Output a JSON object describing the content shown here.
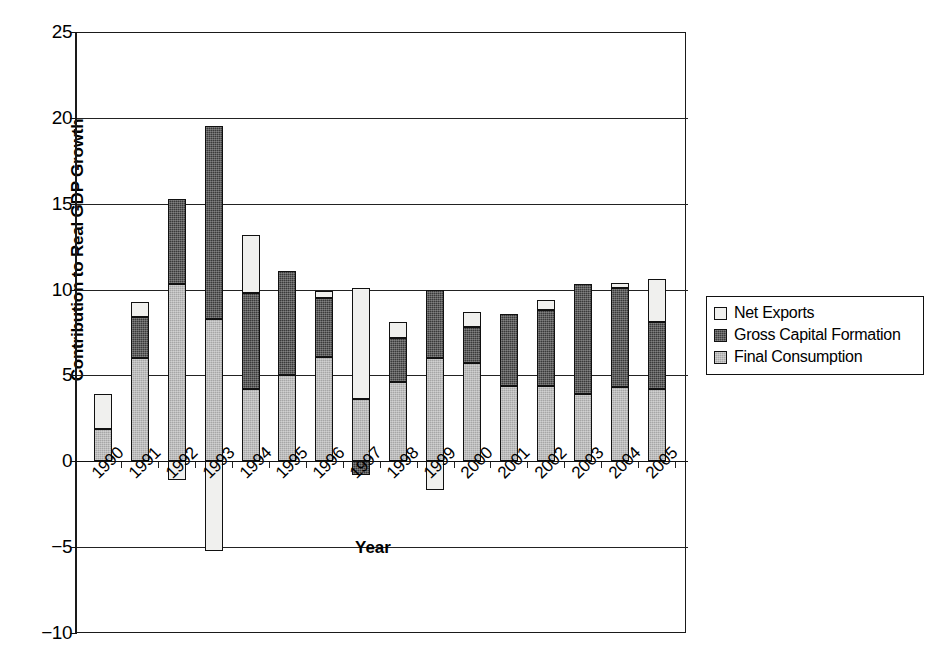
{
  "chart_data": {
    "type": "bar",
    "subtype": "stacked-bar-with-negatives",
    "title": "",
    "xlabel": "Year",
    "ylabel": "Contribution to Real GDP Growth",
    "ylim": [
      -10,
      25
    ],
    "ytick_values": [
      -10,
      -5,
      0,
      5,
      10,
      15,
      20,
      25
    ],
    "ytick_labels": [
      "-10",
      "-5",
      "0",
      "5",
      "10",
      "15",
      "20",
      "25"
    ],
    "grid": true,
    "grid_axis": "y",
    "legend_position": "right",
    "categories": [
      "1990",
      "1991",
      "1992",
      "1993",
      "1994",
      "1995",
      "1996",
      "1997",
      "1998",
      "1999",
      "2000",
      "2001",
      "2002",
      "2003",
      "2004",
      "2005"
    ],
    "series": [
      {
        "name": "Final Consumption",
        "color": "#a6a6a6",
        "values": [
          1.9,
          6.0,
          10.3,
          8.3,
          4.2,
          5.0,
          6.1,
          3.6,
          4.6,
          6.0,
          5.7,
          4.4,
          4.4,
          3.9,
          4.3,
          4.2
        ]
      },
      {
        "name": "Gross Capital Formation",
        "color": "#3a3a3a",
        "values": [
          0.0,
          2.4,
          5.0,
          11.2,
          5.6,
          6.1,
          3.4,
          -0.8,
          2.6,
          4.0,
          2.1,
          4.2,
          4.4,
          6.4,
          5.8,
          3.9
        ]
      },
      {
        "name": "Net Exports",
        "color": "#f0f0ee",
        "values": [
          2.0,
          0.9,
          -1.1,
          -5.2,
          3.4,
          0.0,
          0.4,
          6.5,
          0.9,
          -1.7,
          0.9,
          0.0,
          0.6,
          0.0,
          0.3,
          2.5
        ]
      }
    ],
    "stack_tops": [
      3.9,
      9.3,
      15.3,
      19.5,
      13.2,
      11.1,
      9.9,
      10.1,
      8.1,
      10.0,
      8.7,
      8.6,
      9.4,
      10.3,
      10.4,
      10.6
    ]
  },
  "axes": {
    "y_title": "Contribution to Real GDP Growth",
    "x_title": "Year"
  },
  "legend": {
    "items": [
      {
        "label": "Net Exports",
        "key": "ne"
      },
      {
        "label": "Gross Capital Formation",
        "key": "gcf"
      },
      {
        "label": "Final Consumption",
        "key": "fc"
      }
    ]
  }
}
